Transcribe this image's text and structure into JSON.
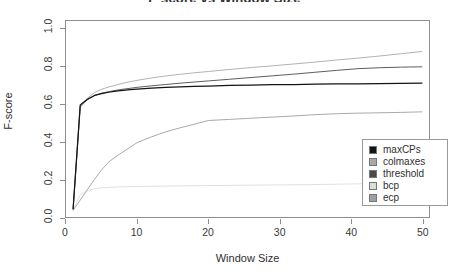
{
  "chart_data": {
    "type": "line",
    "title": "F-score vs Window Size",
    "xlabel": "Window Size",
    "ylabel": "F-score",
    "xlim": [
      0,
      51
    ],
    "ylim": [
      0.0,
      1.04
    ],
    "xticks": [
      "0",
      "10",
      "20",
      "30",
      "40",
      "50"
    ],
    "xtick_values": [
      0,
      10,
      20,
      30,
      40,
      50
    ],
    "yticks": [
      "0.0",
      "0.2",
      "0.4",
      "0.6",
      "0.8",
      "1.0"
    ],
    "ytick_values": [
      0.0,
      0.2,
      0.4,
      0.6,
      0.8,
      1.0
    ],
    "grid": false,
    "legend_position": "bottom-right",
    "x": [
      1,
      2,
      3,
      4,
      5,
      6,
      7,
      8,
      9,
      10,
      12,
      14,
      16,
      18,
      20,
      23,
      26,
      29,
      32,
      35,
      38,
      41,
      44,
      47,
      50
    ],
    "series": [
      {
        "name": "maxCPs",
        "color": "#141414",
        "values": [
          0.045,
          0.595,
          0.625,
          0.645,
          0.655,
          0.662,
          0.668,
          0.672,
          0.676,
          0.679,
          0.684,
          0.688,
          0.691,
          0.693,
          0.695,
          0.698,
          0.7,
          0.702,
          0.703,
          0.705,
          0.706,
          0.707,
          0.708,
          0.709,
          0.71
        ]
      },
      {
        "name": "colmaxes",
        "color": "#a8a8a8",
        "values": [
          0.04,
          0.58,
          0.63,
          0.66,
          0.678,
          0.69,
          0.7,
          0.71,
          0.718,
          0.725,
          0.738,
          0.748,
          0.757,
          0.765,
          0.772,
          0.783,
          0.793,
          0.802,
          0.812,
          0.822,
          0.833,
          0.843,
          0.854,
          0.866,
          0.878
        ]
      },
      {
        "name": "threshold",
        "color": "#4a4a4a",
        "values": [
          0.042,
          0.588,
          0.622,
          0.644,
          0.657,
          0.665,
          0.672,
          0.678,
          0.683,
          0.688,
          0.696,
          0.703,
          0.71,
          0.716,
          0.722,
          0.731,
          0.74,
          0.749,
          0.758,
          0.768,
          0.778,
          0.787,
          0.792,
          0.795,
          0.797
        ]
      },
      {
        "name": "bcp",
        "color": "#dcdcdc",
        "values": [
          0.038,
          0.118,
          0.14,
          0.15,
          0.155,
          0.157,
          0.159,
          0.16,
          0.161,
          0.162,
          0.163,
          0.164,
          0.165,
          0.166,
          0.167,
          0.168,
          0.169,
          0.17,
          0.171,
          0.172,
          0.174,
          0.176,
          0.178,
          0.18,
          0.182
        ]
      },
      {
        "name": "ecp",
        "color": "#9e9e9e",
        "values": [
          0.035,
          0.09,
          0.145,
          0.2,
          0.25,
          0.292,
          0.32,
          0.345,
          0.37,
          0.395,
          0.425,
          0.452,
          0.473,
          0.492,
          0.512,
          0.518,
          0.524,
          0.53,
          0.536,
          0.543,
          0.548,
          0.551,
          0.553,
          0.555,
          0.558
        ]
      }
    ],
    "legend": [
      {
        "label": "maxCPs",
        "color": "#141414"
      },
      {
        "label": "colmaxes",
        "color": "#a8a8a8"
      },
      {
        "label": "threshold",
        "color": "#4a4a4a"
      },
      {
        "label": "bcp",
        "color": "#dcdcdc"
      },
      {
        "label": "ecp",
        "color": "#9e9e9e"
      }
    ]
  }
}
